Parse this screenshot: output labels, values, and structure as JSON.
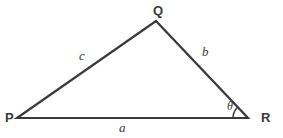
{
  "figure": {
    "type": "geometry-diagram",
    "shape": "triangle",
    "background_color": "#ffffff",
    "stroke_color": "#3a3a3a",
    "stroke_width": 2.2,
    "width": 283,
    "height": 138
  },
  "vertices": [
    {
      "id": "P",
      "label": "P",
      "x": 17,
      "y": 118
    },
    {
      "id": "Q",
      "label": "Q",
      "x": 156,
      "y": 21
    },
    {
      "id": "R",
      "label": "R",
      "x": 248,
      "y": 118
    }
  ],
  "sides": [
    {
      "id": "a",
      "label": "a",
      "between": "P-R",
      "position": "bottom"
    },
    {
      "id": "b",
      "label": "b",
      "between": "Q-R",
      "position": "right"
    },
    {
      "id": "c",
      "label": "c",
      "between": "P-Q",
      "position": "left"
    }
  ],
  "angles": [
    {
      "id": "theta",
      "label": "θ",
      "at_vertex": "R",
      "arc_radius": 15,
      "arc_start_deg": 180,
      "arc_end_deg": 226
    }
  ],
  "icons": {
    "angle_arc": "arc-icon"
  }
}
